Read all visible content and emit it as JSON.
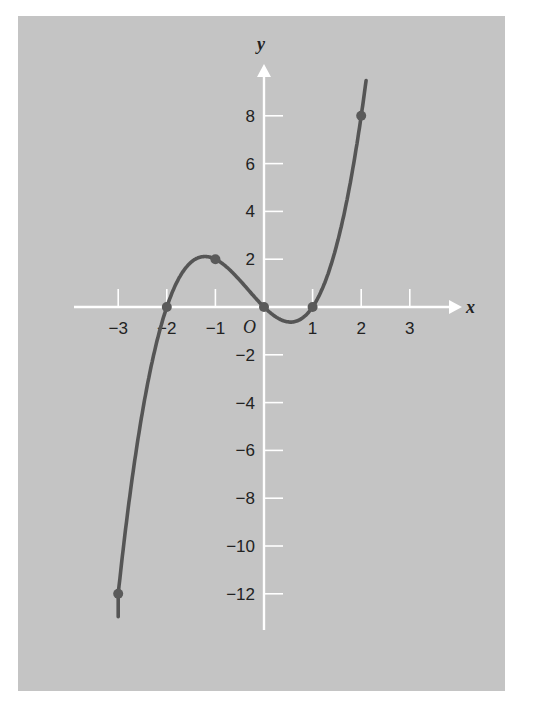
{
  "chart_data": {
    "type": "line",
    "title": "",
    "function": "y = x^3 + x^2 - 2x",
    "xlabel": "x",
    "ylabel": "y",
    "origin_label": "O",
    "xlim": [
      -3.8,
      4
    ],
    "ylim": [
      -13,
      10
    ],
    "grid": false,
    "x_ticks": [
      -3,
      -2,
      -1,
      1,
      2,
      3
    ],
    "x_tick_labels": [
      "−3",
      "−2",
      "−1",
      "1",
      "2",
      "3"
    ],
    "y_ticks": [
      8,
      6,
      4,
      2,
      -2,
      -4,
      -6,
      -8,
      -10,
      -12
    ],
    "y_tick_labels": [
      "8",
      "6",
      "4",
      "2",
      "−2",
      "−4",
      "−6",
      "−8",
      "−10",
      "−12"
    ],
    "marked_points": [
      {
        "x": -3,
        "y": -12
      },
      {
        "x": -2,
        "y": 0
      },
      {
        "x": -1,
        "y": 2
      },
      {
        "x": 0,
        "y": 0
      },
      {
        "x": 1,
        "y": 0
      },
      {
        "x": 2,
        "y": 8
      }
    ],
    "curve_x_range": [
      -3,
      2.1
    ],
    "series": [
      {
        "name": "f(x)",
        "x": [
          -3,
          -2.5,
          -2,
          -1.5,
          -1,
          -0.5,
          0,
          0.5,
          1,
          1.5,
          2
        ],
        "values": [
          -12,
          -4.375,
          0,
          1.875,
          2,
          1.125,
          0,
          -0.625,
          0,
          2.625,
          8
        ]
      }
    ],
    "colors": {
      "panel": "#c4c4c4",
      "axes": "#ffffff",
      "curve": "#555555",
      "text": "#222222"
    }
  }
}
